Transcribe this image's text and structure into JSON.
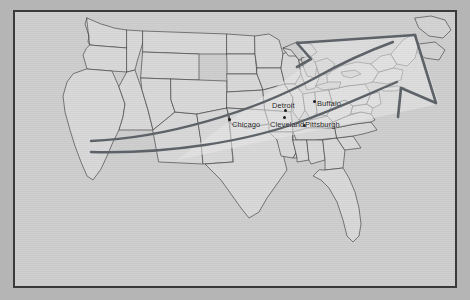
{
  "image": {
    "title": "Northeast Corridor Flow Map",
    "width": 470,
    "height": 300
  },
  "frame": {
    "border_color": "#3a3a3a",
    "mat_color": "#b5b5b5",
    "plate_color": "#cfcfcf"
  },
  "map": {
    "region_name": "United States",
    "land_fill": "#d8d8d8",
    "state_border_color": "#4a4a4a",
    "coast_color": "#3c3c3c",
    "water_color": "#cfcfcf"
  },
  "arrow": {
    "name": "northeast-flow-arrow",
    "direction": "northeast",
    "outline_color": "#5c6168",
    "fill_color": "#e6e6e6",
    "shaft_color": "#5c6168",
    "origin_label": "",
    "tip_label": ""
  },
  "cities": [
    {
      "name": "Chicago",
      "x": 232,
      "y": 120,
      "dot_x": 228,
      "dot_y": 118
    },
    {
      "name": "Detroit",
      "x": 272,
      "y": 101,
      "dot_x": 284,
      "dot_y": 109
    },
    {
      "name": "Cleveland",
      "x": 270,
      "y": 120,
      "dot_x": 283,
      "dot_y": 116
    },
    {
      "name": "Pittsburgh",
      "x": 305,
      "y": 120,
      "dot_x": 303,
      "dot_y": 124
    },
    {
      "name": "Buffalo",
      "x": 317,
      "y": 99,
      "dot_x": 313,
      "dot_y": 100
    }
  ]
}
